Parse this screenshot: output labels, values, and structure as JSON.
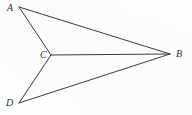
{
  "figure": {
    "kind": "geometry-line-diagram",
    "width": 192,
    "height": 115,
    "background_color": "#fdfdfd",
    "line_color": "#3b3b3b",
    "label_color": "#2f2f2f",
    "points": [
      {
        "id": "A",
        "label": "A",
        "x": 19,
        "y": 7,
        "label_x": 7,
        "label_y": 3
      },
      {
        "id": "B",
        "label": "B",
        "x": 170,
        "y": 54,
        "label_x": 176,
        "label_y": 49
      },
      {
        "id": "C",
        "label": "C",
        "x": 51,
        "y": 55,
        "label_x": 40,
        "label_y": 50
      },
      {
        "id": "D",
        "label": "D",
        "x": 19,
        "y": 103,
        "label_x": 6,
        "label_y": 98
      }
    ],
    "segments": [
      {
        "id": "AB",
        "from": "A",
        "to": "B"
      },
      {
        "id": "AC",
        "from": "A",
        "to": "C"
      },
      {
        "id": "CB",
        "from": "C",
        "to": "B"
      },
      {
        "id": "CD",
        "from": "C",
        "to": "D"
      },
      {
        "id": "DB",
        "from": "D",
        "to": "B"
      }
    ]
  }
}
